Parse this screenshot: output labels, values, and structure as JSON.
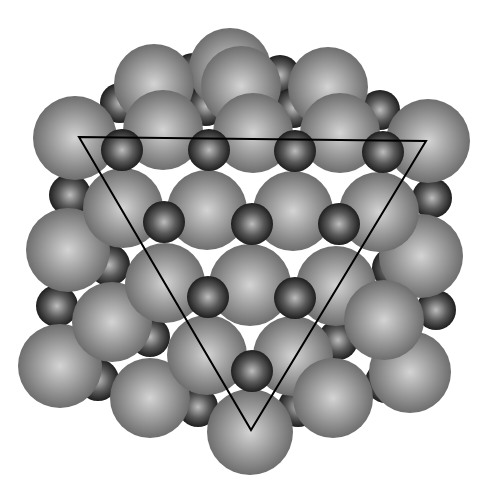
{
  "diagram": {
    "title": "Rock-salt lattice viewed along [111] with triangular (111) plane outline",
    "width": 488,
    "height": 489,
    "colors": {
      "background": "#ffffff",
      "large_highlight": "#d4d4d4",
      "large_mid": "#9c9c9c",
      "large_edge": "#6e6e6e",
      "small_highlight": "#bdbdbd",
      "small_mid": "#5a5a5a",
      "small_edge": "#1e1e1e",
      "triangle": "#000000"
    },
    "layers": [
      {
        "name": "back-small",
        "kind": "small",
        "spheres": [
          [
            193,
            73,
            20
          ],
          [
            280,
            75,
            20
          ],
          [
            120,
            103,
            20
          ],
          [
            206,
            106,
            20
          ],
          [
            293,
            108,
            20
          ],
          [
            380,
            110,
            20
          ]
        ]
      },
      {
        "name": "back-large",
        "kind": "large",
        "spheres": [
          [
            230,
            69,
            41
          ],
          [
            154,
            84,
            40
          ],
          [
            241,
            86,
            40
          ],
          [
            328,
            87,
            40
          ]
        ]
      },
      {
        "name": "mid-small-1",
        "kind": "small",
        "spheres": [
          [
            70,
            195,
            21
          ],
          [
            109,
            265,
            21
          ],
          [
            57,
            306,
            21
          ],
          [
            98,
            380,
            21
          ],
          [
            432,
            198,
            20
          ],
          [
            393,
            268,
            21
          ],
          [
            436,
            310,
            20
          ],
          [
            386,
            382,
            21
          ],
          [
            150,
            337,
            20
          ],
          [
            338,
            340,
            20
          ],
          [
            198,
            407,
            20
          ],
          [
            298,
            407,
            20
          ]
        ]
      },
      {
        "name": "front-large-row-a",
        "kind": "large",
        "spheres": [
          [
            75,
            138,
            42
          ],
          [
            163,
            130,
            40
          ],
          [
            253,
            133,
            40
          ],
          [
            340,
            133,
            40
          ],
          [
            428,
            141,
            42
          ]
        ]
      },
      {
        "name": "front-large-row-b",
        "kind": "large",
        "spheres": [
          [
            68,
            250,
            42
          ],
          [
            421,
            256,
            42
          ]
        ]
      },
      {
        "name": "front-large-row-c",
        "kind": "large",
        "spheres": [
          [
            123,
            208,
            40
          ],
          [
            207,
            210,
            40
          ],
          [
            293,
            211,
            40
          ],
          [
            379,
            212,
            40
          ]
        ]
      },
      {
        "name": "front-large-row-d",
        "kind": "large",
        "spheres": [
          [
            60,
            366,
            42
          ],
          [
            410,
            372,
            41
          ]
        ]
      },
      {
        "name": "front-large-row-e",
        "kind": "large",
        "spheres": [
          [
            112,
            322,
            40
          ],
          [
            165,
            283,
            40
          ],
          [
            250,
            285,
            41
          ],
          [
            336,
            286,
            40
          ],
          [
            384,
            320,
            40
          ]
        ]
      },
      {
        "name": "front-large-row-f",
        "kind": "large",
        "spheres": [
          [
            150,
            398,
            40
          ],
          [
            207,
            355,
            40
          ],
          [
            293,
            356,
            40
          ],
          [
            333,
            398,
            40
          ]
        ]
      },
      {
        "name": "front-large-bottom",
        "kind": "large",
        "spheres": [
          [
            250,
            432,
            43
          ]
        ]
      },
      {
        "name": "front-small",
        "kind": "small",
        "spheres": [
          [
            122,
            150,
            21
          ],
          [
            209,
            150,
            21
          ],
          [
            295,
            151,
            21
          ],
          [
            383,
            152,
            21
          ],
          [
            164,
            222,
            21
          ],
          [
            252,
            224,
            21
          ],
          [
            339,
            224,
            21
          ],
          [
            208,
            297,
            21
          ],
          [
            295,
            298,
            21
          ],
          [
            252,
            371,
            21
          ]
        ]
      }
    ],
    "triangle": {
      "points": [
        [
          79,
          137
        ],
        [
          426,
          141
        ],
        [
          251,
          430
        ]
      ],
      "stroke_width": 2
    }
  }
}
